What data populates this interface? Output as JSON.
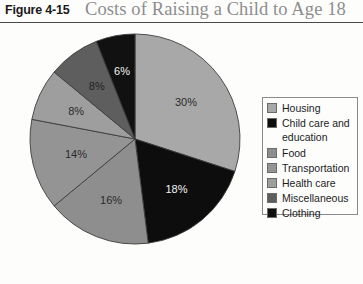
{
  "figure": {
    "number_label": "Figure 4-15",
    "title": "Costs of Raising a Child to Age 18"
  },
  "legend": {
    "items": [
      {
        "label": "Housing",
        "color": "#a8a8a8",
        "swatch_name": "legend-swatch-housing"
      },
      {
        "label": "Child care and\neducation",
        "color": "#0d0d0d",
        "swatch_name": "legend-swatch-child-care-and-education"
      },
      {
        "label": "Food",
        "color": "#8e8e8e",
        "swatch_name": "legend-swatch-food"
      },
      {
        "label": "Transportation",
        "color": "#949494",
        "swatch_name": "legend-swatch-transportation"
      },
      {
        "label": "Health care",
        "color": "#9e9e9e",
        "swatch_name": "legend-swatch-health-care"
      },
      {
        "label": "Miscellaneous",
        "color": "#5e5e5e",
        "swatch_name": "legend-swatch-miscellaneous"
      },
      {
        "label": "Clothing",
        "color": "#111111",
        "swatch_name": "legend-swatch-clothing"
      }
    ]
  },
  "chart_data": {
    "type": "pie",
    "title": "Costs of Raising a Child to Age 18",
    "xlabel": "",
    "ylabel": "",
    "units": "percent",
    "start_angle_deg": 0,
    "direction": "clockwise",
    "legend_position": "right",
    "grid": false,
    "categories": [
      "Housing",
      "Child care and education",
      "Food",
      "Transportation",
      "Health care",
      "Miscellaneous",
      "Clothing"
    ],
    "values": [
      30,
      18,
      16,
      14,
      8,
      8,
      6
    ],
    "data_labels": [
      "30%",
      "18%",
      "16%",
      "14%",
      "8%",
      "8%",
      "6%"
    ],
    "colors": [
      "#a8a8a8",
      "#0d0d0d",
      "#8e8e8e",
      "#949494",
      "#9e9e9e",
      "#5e5e5e",
      "#111111"
    ],
    "label_colors": [
      "#2b2b2b",
      "#f2f2f2",
      "#2b2b2b",
      "#2b2b2b",
      "#2b2b2b",
      "#1f1f1f",
      "#f2f2f2"
    ],
    "label_radius_fraction": [
      0.6,
      0.62,
      0.62,
      0.58,
      0.62,
      0.62,
      0.66
    ],
    "total": 100
  }
}
